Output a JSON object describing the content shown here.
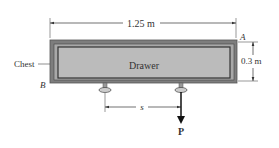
{
  "diagram": {
    "labels": {
      "width_dimension": "1.25 m",
      "height_dimension": "0.3 m",
      "chest": "Chest",
      "drawer": "Drawer",
      "point_a": "A",
      "point_b": "B",
      "distance": "s",
      "force": "P"
    },
    "colors": {
      "chest_fill": "#7d7d7d",
      "chest_inner_fill": "#9a9a9a",
      "drawer_fill": "#b9b9b9",
      "drawer_border": "#444444",
      "line": "#333333",
      "force_arrow": "#111111"
    }
  }
}
